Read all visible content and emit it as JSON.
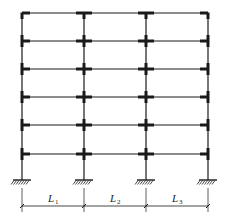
{
  "diagram": {
    "type": "multi-storey plane frame",
    "stories": 6,
    "bays": 3,
    "columns_x": [
      22,
      84,
      146,
      208
    ],
    "floors_y": [
      13,
      41,
      69,
      97,
      125,
      154
    ],
    "base_y": 180,
    "support_type": "fixed",
    "dimension_line_y": 206,
    "spans": [
      {
        "label": "L",
        "subscript": "1"
      },
      {
        "label": "L",
        "subscript": "2"
      },
      {
        "label": "L",
        "subscript": "3"
      }
    ],
    "colors": {
      "line": "#1a1a1a",
      "background": "#ffffff"
    }
  }
}
